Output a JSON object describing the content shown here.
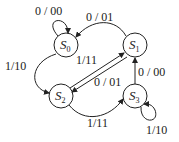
{
  "diagram": {
    "type": "state-transition-diagram",
    "states": [
      {
        "id": "S0",
        "letter": "S",
        "sub": "0"
      },
      {
        "id": "S1",
        "letter": "S",
        "sub": "1"
      },
      {
        "id": "S2",
        "letter": "S",
        "sub": "2"
      },
      {
        "id": "S3",
        "letter": "S",
        "sub": "3"
      }
    ],
    "transitions": [
      {
        "from": "S0",
        "to": "S0",
        "label": "0 / 00"
      },
      {
        "from": "S1",
        "to": "S0",
        "label": "0 / 01"
      },
      {
        "from": "S0",
        "to": "S2",
        "label": "1/10"
      },
      {
        "from": "S2",
        "to": "S1",
        "label": "1/11"
      },
      {
        "from": "S1",
        "to": "S2",
        "label": "0 / 01"
      },
      {
        "from": "S2",
        "to": "S3",
        "label": "1/11"
      },
      {
        "from": "S3",
        "to": "S1",
        "label": "0 / 00"
      },
      {
        "from": "S3",
        "to": "S3",
        "label": "1/10"
      }
    ],
    "colors": {
      "stroke": "#222222",
      "background": "#ffffff"
    }
  }
}
